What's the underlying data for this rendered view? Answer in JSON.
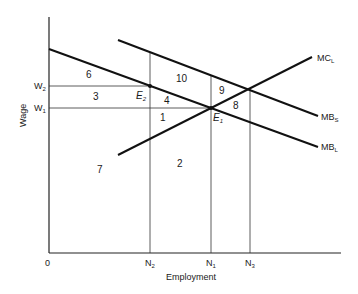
{
  "diagram": {
    "type": "labor-market-externality",
    "axes": {
      "x_label": "Employment",
      "y_label": "Wage",
      "origin": "0"
    },
    "curves": [
      {
        "id": "MC_L",
        "base": "MC",
        "sub": "L"
      },
      {
        "id": "MB_S",
        "base": "MB",
        "sub": "S"
      },
      {
        "id": "MB_L",
        "base": "MB",
        "sub": "L"
      }
    ],
    "y_ticks": [
      {
        "base": "W",
        "sub": "2"
      },
      {
        "base": "W",
        "sub": "1"
      }
    ],
    "x_ticks": [
      {
        "base": "N",
        "sub": "2"
      },
      {
        "base": "N",
        "sub": "1"
      },
      {
        "base": "N",
        "sub": "3"
      }
    ],
    "points": [
      {
        "base": "E",
        "sub": "2"
      },
      {
        "base": "E",
        "sub": "1"
      }
    ],
    "areas": [
      "1",
      "2",
      "3",
      "4",
      "6",
      "7",
      "8",
      "9",
      "10"
    ]
  }
}
